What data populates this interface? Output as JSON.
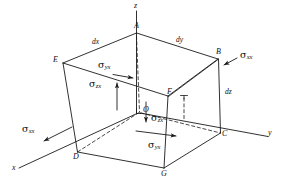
{
  "figure": {
    "background_color": "#ffffff",
    "line_color": "#1a1a1a"
  },
  "axes": [
    {
      "name": "z-axis",
      "label": "z",
      "direction": "up"
    },
    {
      "name": "y-axis",
      "label": "y",
      "direction": "right"
    },
    {
      "name": "x-axis",
      "label": "x",
      "direction": "lower-left"
    }
  ],
  "vertices": [
    {
      "name": "A",
      "label": "A"
    },
    {
      "name": "B",
      "label": "B"
    },
    {
      "name": "C",
      "label": "C"
    },
    {
      "name": "D",
      "label": "D"
    },
    {
      "name": "E",
      "label": "E"
    },
    {
      "name": "F",
      "label": "F"
    },
    {
      "name": "G",
      "label": "G"
    },
    {
      "name": "O",
      "label": "O"
    }
  ],
  "dimensions": [
    {
      "name": "dx",
      "label": "dx",
      "edge": "A-E top-left edge"
    },
    {
      "name": "dy",
      "label": "dy",
      "edge": "A-B top-right edge"
    },
    {
      "name": "dz",
      "label": "dz",
      "edge": "B-C right vertical edge"
    }
  ],
  "stresses": [
    {
      "name": "sigma-yx-top",
      "symbol": "σ",
      "sub": "yx",
      "arrow": "right",
      "location": "top face, left of center"
    },
    {
      "name": "sigma-xx-right",
      "symbol": "σ",
      "sub": "xx",
      "arrow": "lower-left",
      "location": "near vertex B"
    },
    {
      "name": "sigma-zx-left",
      "symbol": "σ",
      "sub": "zx",
      "arrow": "up",
      "location": "left interior, upward"
    },
    {
      "name": "sigma-zx-center",
      "symbol": "σ",
      "sub": "zx",
      "arrow": "down",
      "location": "center interior, downward"
    },
    {
      "name": "sigma-xx-left",
      "symbol": "σ",
      "sub": "xx",
      "arrow": "lower-left",
      "location": "left of vertex D"
    },
    {
      "name": "sigma-yx-bottom",
      "symbol": "σ",
      "sub": "yx",
      "arrow": "right",
      "location": "bottom face, center"
    }
  ]
}
